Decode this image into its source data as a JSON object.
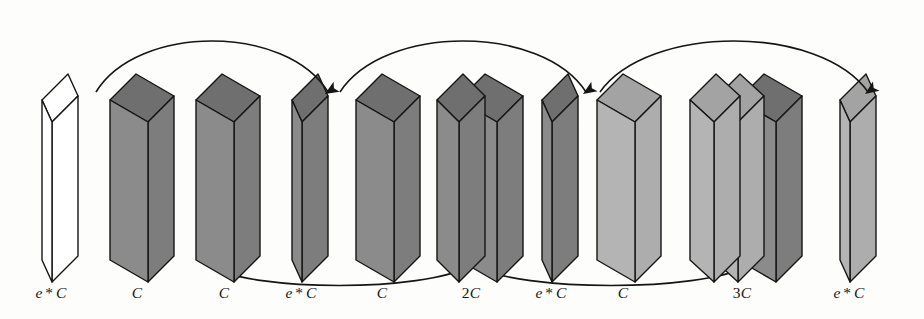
{
  "figure": {
    "width": 924,
    "height": 319,
    "background": "#fdfdfc",
    "stroke": "#151515"
  },
  "palette": {
    "outline": "#151515",
    "empty_face": "#ffffff",
    "empty_top": "#ffffff",
    "empty_side": "#ffffff",
    "dark_face": "#8b8b8b",
    "dark_top": "#6f6f6f",
    "dark_side": "#7d7d7d",
    "mid_face": "#9a9a9a",
    "light_face": "#b4b4b4",
    "light_top": "#a3a3a3",
    "light_side": "#adadad"
  },
  "geometry": {
    "front_height": 160,
    "front_top_y": 78,
    "skew_dy": 22,
    "depth_dx": 26,
    "depth_dy": -26,
    "baseline_y": 238
  },
  "blocks": [
    {
      "id": "block-0",
      "label": "e * C",
      "label_parts": {
        "pre": "e",
        "star": "*",
        "post": "C"
      },
      "label_x": 51,
      "x": 42,
      "slabs": [
        {
          "width": 10,
          "shade": "empty"
        }
      ],
      "shade": "empty",
      "thickness": "thin"
    },
    {
      "id": "block-1",
      "label": "C",
      "label_parts": {
        "pre": "",
        "star": "",
        "post": "C"
      },
      "label_x": 137,
      "x": 110,
      "slabs": [
        {
          "width": 38,
          "shade": "dark"
        }
      ],
      "shade": "dark",
      "thickness": "thick"
    },
    {
      "id": "block-2",
      "label": "C",
      "label_parts": {
        "pre": "",
        "star": "",
        "post": "C"
      },
      "label_x": 224,
      "x": 196,
      "slabs": [
        {
          "width": 38,
          "shade": "dark"
        }
      ],
      "shade": "dark",
      "thickness": "thick"
    },
    {
      "id": "block-3",
      "label": "e * C",
      "label_parts": {
        "pre": "e",
        "star": "*",
        "post": "C"
      },
      "label_x": 301,
      "x": 292,
      "slabs": [
        {
          "width": 10,
          "shade": "dark"
        }
      ],
      "shade": "dark",
      "thickness": "thin"
    },
    {
      "id": "block-4",
      "label": "C",
      "label_parts": {
        "pre": "",
        "star": "",
        "post": "C"
      },
      "label_x": 382,
      "x": 356,
      "slabs": [
        {
          "width": 38,
          "shade": "dark"
        }
      ],
      "shade": "dark",
      "thickness": "thick"
    },
    {
      "id": "block-5",
      "label": "2C",
      "label_parts": {
        "pre": "",
        "star": "",
        "post": "2C"
      },
      "label_x": 471,
      "x": 437,
      "slabs": [
        {
          "width": 22,
          "shade": "dark"
        },
        {
          "width": 38,
          "shade": "dark"
        }
      ],
      "shade": "dark",
      "thickness": "double"
    },
    {
      "id": "block-6",
      "label": "e * C",
      "label_parts": {
        "pre": "e",
        "star": "*",
        "post": "C"
      },
      "label_x": 551,
      "x": 542,
      "slabs": [
        {
          "width": 10,
          "shade": "dark"
        }
      ],
      "shade": "dark",
      "thickness": "thin"
    },
    {
      "id": "block-7",
      "label": "C",
      "label_parts": {
        "pre": "",
        "star": "",
        "post": "C"
      },
      "label_x": 623,
      "x": 597,
      "slabs": [
        {
          "width": 38,
          "shade": "light"
        }
      ],
      "shade": "light",
      "thickness": "thick"
    },
    {
      "id": "block-8",
      "label": "3C",
      "label_parts": {
        "pre": "",
        "star": "",
        "post": "3C"
      },
      "label_x": 742,
      "x": 690,
      "slabs": [
        {
          "width": 24,
          "shade": "light"
        },
        {
          "width": 24,
          "shade": "light"
        },
        {
          "width": 38,
          "shade": "dark"
        }
      ],
      "shade": "mixed",
      "thickness": "triple"
    },
    {
      "id": "block-9",
      "label": "e * C",
      "label_parts": {
        "pre": "e",
        "star": "*",
        "post": "C"
      },
      "label_x": 849,
      "x": 840,
      "slabs": [
        {
          "width": 10,
          "shade": "light"
        }
      ],
      "shade": "light",
      "thickness": "thin"
    }
  ],
  "top_arcs": [
    {
      "id": "skip-top-1",
      "from_block": "block-0",
      "to_block": "block-3",
      "x1": 96,
      "x2": 328,
      "peak_y": 24,
      "arrow": "down"
    },
    {
      "id": "skip-top-2",
      "from_block": "block-3",
      "to_block": "block-6",
      "x1": 340,
      "x2": 586,
      "peak_y": 24,
      "arrow": "down"
    },
    {
      "id": "skip-top-3",
      "from_block": "block-6",
      "to_block": "block-9",
      "x1": 600,
      "x2": 868,
      "peak_y": 24,
      "arrow": "down"
    }
  ],
  "bottom_arcs": [
    {
      "id": "concat-bottom-1",
      "from_block": "block-2",
      "to_block": "block-5",
      "x1": 208,
      "x2": 470,
      "dip_y": 292,
      "arrow": "up"
    },
    {
      "id": "concat-bottom-2",
      "from_block": "block-5",
      "to_block": "block-8",
      "x1": 474,
      "x2": 748,
      "dip_y": 292,
      "arrow": "up"
    }
  ],
  "captions": [
    {
      "text": "e * C",
      "x": 51
    },
    {
      "text": "C",
      "x": 137
    },
    {
      "text": "C",
      "x": 224
    },
    {
      "text": "e * C",
      "x": 301
    },
    {
      "text": "C",
      "x": 382
    },
    {
      "text": "2C",
      "x": 471
    },
    {
      "text": "e * C",
      "x": 551
    },
    {
      "text": "C",
      "x": 623
    },
    {
      "text": "3C",
      "x": 742
    },
    {
      "text": "e * C",
      "x": 849
    }
  ],
  "caption_y": 284
}
